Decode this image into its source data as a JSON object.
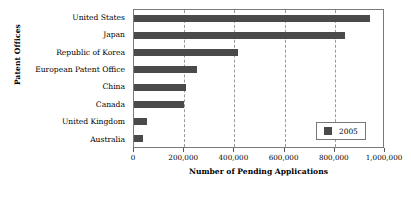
{
  "chart_data": {
    "type": "bar",
    "orientation": "horizontal",
    "title": "",
    "xlabel": "Number of Pending Applications",
    "ylabel": "Patent Offices",
    "categories": [
      "United States",
      "Japan",
      "Republic of Korea",
      "European Patent Office",
      "China",
      "Canada",
      "United Kingdom",
      "Australia"
    ],
    "series": [
      {
        "name": "2005",
        "color": "#4a4a4a",
        "values": [
          940000,
          840000,
          415000,
          250000,
          207000,
          200000,
          50000,
          35000
        ]
      }
    ],
    "xlim": [
      0,
      1000000
    ],
    "xticks": [
      0,
      200000,
      400000,
      600000,
      800000,
      1000000
    ],
    "xtick_labels": [
      "0",
      "200,000",
      "400,000",
      "600,000",
      "800,000",
      "1,000,000"
    ],
    "grid": "vertical-dashed",
    "legend_position": "inside-bottom-right",
    "legend_entries": [
      "2005"
    ]
  },
  "legend": {
    "label": "2005",
    "swatch_color": "#4a4a4a"
  },
  "axes": {
    "x_title": "Number of Pending Applications",
    "y_title": "Patent Offices"
  }
}
